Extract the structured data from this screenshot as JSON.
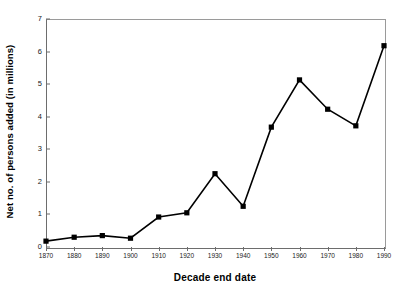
{
  "chart_data": {
    "type": "line",
    "title": "",
    "xlabel": "Decade end date",
    "ylabel": "Net no. of persons added (in millions)",
    "x": [
      1870,
      1880,
      1890,
      1900,
      1910,
      1920,
      1930,
      1940,
      1950,
      1960,
      1970,
      1980,
      1990
    ],
    "categories": [
      "1870",
      "1880",
      "1890",
      "1900",
      "1910",
      "1920",
      "1930",
      "1940",
      "1950",
      "1960",
      "1970",
      "1980",
      "1990"
    ],
    "values": [
      0.18,
      0.3,
      0.35,
      0.27,
      0.92,
      1.05,
      2.25,
      1.25,
      3.68,
      5.13,
      4.23,
      3.72,
      6.18
    ],
    "xlim": [
      1870,
      1990
    ],
    "ylim": [
      0,
      7
    ],
    "y_ticks": [
      0,
      1,
      2,
      3,
      4,
      5,
      6,
      7
    ],
    "y_tick_labels": [
      "0",
      "1",
      "2",
      "3",
      "4",
      "5",
      "6",
      "7"
    ],
    "x_ticks": [
      1870,
      1880,
      1890,
      1900,
      1910,
      1920,
      1930,
      1940,
      1950,
      1960,
      1970,
      1980,
      1990
    ],
    "x_tick_labels": [
      "1870",
      "1880",
      "1890",
      "1900",
      "1910",
      "1920",
      "1930",
      "1940",
      "1950",
      "1960",
      "1970",
      "1980",
      "1990"
    ],
    "grid": false,
    "legend": false,
    "marker": "square",
    "marker_color": "#000000",
    "line_color": "#000000",
    "background_color": "#ffffff",
    "axis_color": "#6d6d6d",
    "frame_color": "#9a9a9a",
    "series": [
      {
        "name": "Net persons added",
        "values": [
          0.18,
          0.3,
          0.35,
          0.27,
          0.92,
          1.05,
          2.25,
          1.25,
          3.68,
          5.13,
          4.23,
          3.72,
          6.18
        ]
      }
    ]
  },
  "axes": {
    "x_title": "Decade end date",
    "y_title": "Net no. of persons added (in millions)"
  }
}
